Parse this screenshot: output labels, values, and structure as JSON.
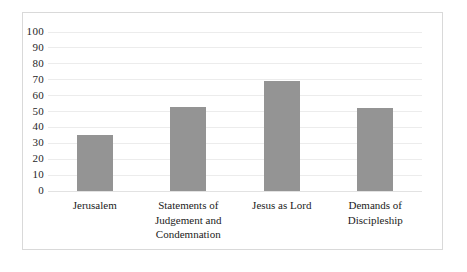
{
  "chart_data": {
    "type": "bar",
    "title": "",
    "subtitle": "",
    "xlabel": "",
    "ylabel": "",
    "categories": [
      "Jerusalem",
      "Statements of Judgement and Condemnation",
      "Jesus as Lord",
      "Demands of Discipleship"
    ],
    "values": [
      35,
      53,
      69,
      52
    ],
    "ylim": [
      0,
      100
    ],
    "yticks": [
      0,
      10,
      20,
      30,
      40,
      50,
      60,
      70,
      80,
      90,
      100
    ],
    "ytick_labels": [
      "0",
      "10",
      "20",
      "30",
      "40",
      "50",
      "60",
      "70",
      "80",
      "90",
      "100"
    ],
    "grid": true,
    "legend": false,
    "legend_position": "none",
    "bar_color": "#949494",
    "gridline_color": "#ececec",
    "frame_color": "#d9d9d9",
    "background_color": "#ffffff",
    "text_color": "#1b1b1b"
  }
}
